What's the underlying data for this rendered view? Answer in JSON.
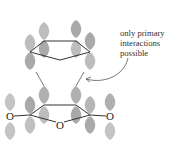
{
  "diagram": {
    "annotation": {
      "lines": [
        "only primary",
        "interactions",
        "possible"
      ]
    },
    "atoms": {
      "oxygen_left": "O",
      "oxygen_center": "O",
      "oxygen_right": "O"
    },
    "colors": {
      "lobe_fill": "#a8a8a8",
      "lobe_fill_light": "#c8c8c8",
      "bond": "#333333",
      "text": "#333333"
    }
  }
}
